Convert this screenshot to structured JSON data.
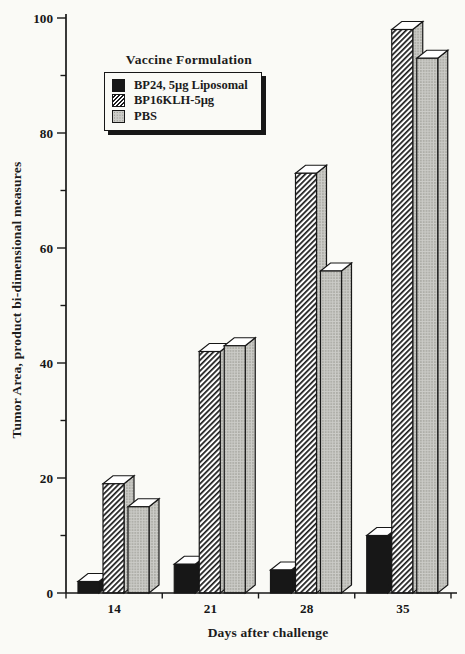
{
  "chart_data": {
    "type": "bar",
    "style": "3d-extruded-bars",
    "title": "",
    "xlabel": "Days after challenge",
    "ylabel": "Tumor Area, product bi-dimensional measures",
    "categories": [
      "14",
      "21",
      "28",
      "35"
    ],
    "series": [
      {
        "name": "BP24, 5µg Liposomal",
        "style": "solid-black",
        "values": [
          2,
          5,
          4,
          10
        ]
      },
      {
        "name": "BP16KLH-5µg",
        "style": "diagonal-hatch",
        "values": [
          19,
          42,
          73,
          98
        ]
      },
      {
        "name": "PBS",
        "style": "gray-stipple",
        "values": [
          15,
          43,
          56,
          93
        ]
      }
    ],
    "ylim": [
      0,
      100
    ],
    "ytick_major": 20,
    "ytick_minor": 10,
    "grid": false,
    "legend_title": "Vaccine Formulation",
    "legend_position": "upper-left"
  },
  "colors": {
    "paper": "#fafaf6",
    "ink": "#171717",
    "bar_black": "#171717",
    "hatch_line": "#1c1c1c",
    "hatch_bg": "#ffffff",
    "stipple_bg": "#ccccc8",
    "stipple_dot": "#87877f",
    "bar_top_face": "#ffffff"
  }
}
